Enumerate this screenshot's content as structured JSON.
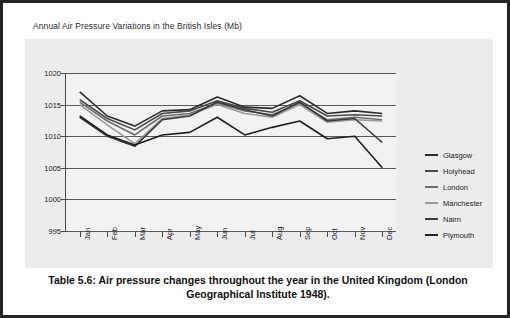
{
  "figure": {
    "title": "Annual Air Pressure Variations in the British Isles (Mb)",
    "caption": "Table 5.6: Air pressure changes throughout the year in the United Kingdom (London Geographical Institute 1948)."
  },
  "chart_data": {
    "type": "line",
    "title": "Annual Air Pressure Variations in the British Isles (Mb)",
    "xlabel": "",
    "ylabel": "",
    "ylim": [
      995,
      1020
    ],
    "yticks": [
      995,
      1000,
      1005,
      1010,
      1015,
      1020
    ],
    "grid": true,
    "legend_position": "right",
    "categories": [
      "Jan",
      "Feb",
      "Mar",
      "Apr",
      "May",
      "Jun",
      "Jul",
      "Aug",
      "Sep",
      "Oct",
      "Nov",
      "Dec"
    ],
    "series": [
      {
        "name": "Glasgow",
        "color": "#2b2b2b",
        "values": [
          1017.0,
          1013.2,
          1011.6,
          1014.0,
          1014.2,
          1016.2,
          1014.6,
          1014.4,
          1016.4,
          1013.6,
          1014.0,
          1013.6
        ]
      },
      {
        "name": "Holyhead",
        "color": "#4a4a4a",
        "values": [
          1015.8,
          1012.8,
          1011.0,
          1013.6,
          1014.0,
          1015.6,
          1014.4,
          1013.8,
          1015.6,
          1013.2,
          1013.4,
          1013.2
        ]
      },
      {
        "name": "London",
        "color": "#6e6e6e",
        "values": [
          1015.4,
          1012.4,
          1010.2,
          1013.2,
          1013.6,
          1015.2,
          1014.0,
          1013.4,
          1015.2,
          1012.6,
          1013.0,
          1012.6
        ]
      },
      {
        "name": "Manchester",
        "color": "#9a9a9a",
        "values": [
          1015.0,
          1011.8,
          1008.8,
          1012.8,
          1013.4,
          1015.0,
          1013.6,
          1013.0,
          1015.0,
          1012.2,
          1012.6,
          1012.4
        ]
      },
      {
        "name": "Nairn",
        "color": "#3a3a3a",
        "values": [
          1013.0,
          1010.0,
          1008.4,
          1012.6,
          1013.2,
          1015.4,
          1014.2,
          1013.2,
          1015.4,
          1012.4,
          1012.8,
          1009.0
        ]
      },
      {
        "name": "Plymouth",
        "color": "#1f1f1f",
        "values": [
          1013.2,
          1010.2,
          1008.6,
          1010.2,
          1010.6,
          1013.0,
          1010.2,
          1011.4,
          1012.4,
          1009.6,
          1010.0,
          1005.0
        ]
      }
    ]
  },
  "legend": {
    "items": [
      {
        "label": "Glasgow"
      },
      {
        "label": "Holyhead"
      },
      {
        "label": "London"
      },
      {
        "label": "Manchester"
      },
      {
        "label": "Nairn"
      },
      {
        "label": "Plymouth"
      }
    ]
  }
}
